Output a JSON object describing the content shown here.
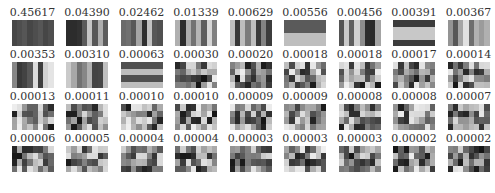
{
  "figure": {
    "values": [
      "0.45617",
      "0.04390",
      "0.02462",
      "0.01339",
      "0.00629",
      "0.00556",
      "0.00456",
      "0.00391",
      "0.00367",
      "0.00353",
      "0.00310",
      "0.00063",
      "0.00030",
      "0.00020",
      "0.00018",
      "0.00018",
      "0.00017",
      "0.00014",
      "0.00013",
      "0.00011",
      "0.00010",
      "0.00010",
      "0.00009",
      "0.00009",
      "0.00008",
      "0.00008",
      "0.00007",
      "0.00006",
      "0.00005",
      "0.00004",
      "0.00004",
      "0.00003",
      "0.00003",
      "0.00003",
      "0.00002",
      "0.00002"
    ]
  }
}
